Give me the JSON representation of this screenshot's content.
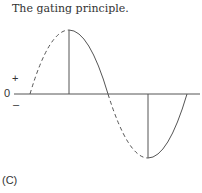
{
  "title": "The gating principle.",
  "axis": {
    "plus": "+",
    "zero": "0",
    "minus": "–"
  },
  "panel_label": "(C)"
}
